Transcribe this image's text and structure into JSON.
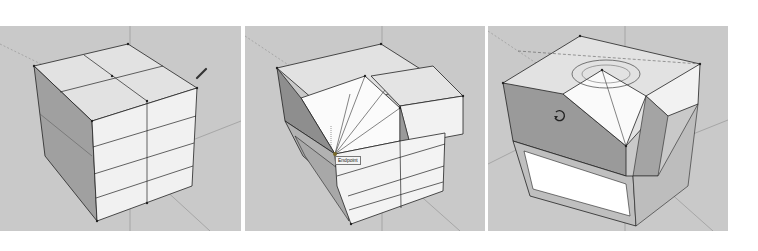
{
  "figure": {
    "panels": [
      {
        "id": "step-1",
        "description": "Box divided into segments, pencil (line) tool cursor",
        "tool_icon": "pencil-icon"
      },
      {
        "id": "step-2",
        "description": "Triangulated top face with inference snap",
        "inference_tooltip": "Endpoint",
        "tool_icon": "pencil-icon"
      },
      {
        "id": "step-3",
        "description": "Rotated geometry with protractor",
        "tool_icon": "rotate-icon",
        "protractor": true
      }
    ],
    "colors": {
      "background": "#c9c9c9",
      "face_light": "#f2f2f2",
      "face_top": "#e0e0e0",
      "face_shade": "#9a9a9a",
      "edge": "#222222",
      "axis": "#8f8f8f"
    }
  }
}
